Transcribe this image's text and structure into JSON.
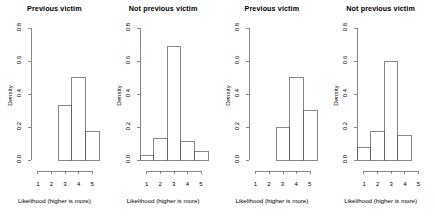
{
  "figure": {
    "background_color": "#ffffff",
    "line_color": "#555555",
    "text_color": "#000000",
    "panel_count": 4
  },
  "chart_data": [
    {
      "type": "bar",
      "title": "Previous victim",
      "xlabel": "Likelihood (higher is more)",
      "ylabel": "Density",
      "categories": [
        "1",
        "2",
        "3",
        "4",
        "5"
      ],
      "values": [
        0,
        0,
        0.33,
        0.5,
        0.17
      ],
      "xlim": [
        0.5,
        5.5
      ],
      "ylim": [
        0,
        0.8
      ],
      "xticks": [
        "1",
        "2",
        "3",
        "4",
        "5"
      ],
      "yticks": [
        "0.0",
        "0.2",
        "0.4",
        "0.6",
        "0.8"
      ],
      "grid": false,
      "legend": "none"
    },
    {
      "type": "bar",
      "title": "Not previous victim",
      "xlabel": "Likelihood (higher is more)",
      "ylabel": "Density",
      "categories": [
        "1",
        "2",
        "3",
        "4",
        "5"
      ],
      "values": [
        0.03,
        0.13,
        0.69,
        0.11,
        0.05
      ],
      "xlim": [
        0.5,
        5.5
      ],
      "ylim": [
        0,
        0.8
      ],
      "xticks": [
        "1",
        "2",
        "3",
        "4",
        "5"
      ],
      "yticks": [
        "0.0",
        "0.2",
        "0.4",
        "0.6",
        "0.8"
      ],
      "grid": false,
      "legend": "none"
    },
    {
      "type": "bar",
      "title": "Previous victim",
      "xlabel": "Likelihood (higher is more)",
      "ylabel": "Density",
      "categories": [
        "1",
        "2",
        "3",
        "4",
        "5"
      ],
      "values": [
        0,
        0,
        0.2,
        0.5,
        0.3
      ],
      "xlim": [
        0.5,
        5.5
      ],
      "ylim": [
        0,
        0.8
      ],
      "xticks": [
        "1",
        "2",
        "3",
        "4",
        "5"
      ],
      "yticks": [
        "0.0",
        "0.2",
        "0.4",
        "0.6",
        "0.8"
      ],
      "grid": false,
      "legend": "none"
    },
    {
      "type": "bar",
      "title": "Not previous victim",
      "xlabel": "Likelihood (higher is more)",
      "ylabel": "Density",
      "categories": [
        "1",
        "2",
        "3",
        "4",
        "5"
      ],
      "values": [
        0.075,
        0.175,
        0.6,
        0.15,
        0
      ],
      "xlim": [
        0.5,
        5.5
      ],
      "ylim": [
        0,
        0.8
      ],
      "xticks": [
        "1",
        "2",
        "3",
        "4",
        "5"
      ],
      "yticks": [
        "0.0",
        "0.2",
        "0.4",
        "0.6",
        "0.8"
      ],
      "grid": false,
      "legend": "none"
    }
  ]
}
